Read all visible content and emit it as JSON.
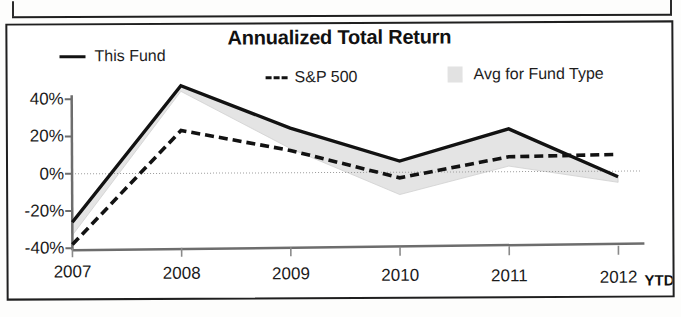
{
  "chart": {
    "title": "Annualized Total Return",
    "legend": [
      {
        "label": "This Fund",
        "marker": "solid-line-swatch"
      },
      {
        "label": "S&P 500",
        "marker": "dashed-line-swatch"
      },
      {
        "label": "Avg for Fund Type",
        "marker": "area-swatch"
      }
    ],
    "ytd_suffix": "YTD"
  },
  "chart_data": {
    "type": "line",
    "title": "Annualized Total Return",
    "xlabel": "",
    "ylabel": "",
    "categories": [
      "2007",
      "2008",
      "2009",
      "2010",
      "2011",
      "2012"
    ],
    "x_tick_labels": [
      "2007",
      "2008",
      "2009",
      "2010",
      "2011",
      "2012"
    ],
    "x_axis_note": "YTD",
    "y_tick_labels": [
      "40%",
      "20%",
      "0%",
      "-20%",
      "-40%"
    ],
    "y_ticks": [
      40,
      20,
      0,
      -20,
      -40
    ],
    "ylim": [
      -40,
      50
    ],
    "grid": false,
    "legend_position": "top",
    "series": [
      {
        "name": "This Fund",
        "style": "solid",
        "color": "#121212",
        "values": [
          -26,
          47,
          24,
          6,
          23,
          -3
        ]
      },
      {
        "name": "S&P 500",
        "style": "dashed",
        "color": "#121212",
        "values": [
          -38,
          23,
          12,
          -3,
          8,
          9
        ]
      },
      {
        "name": "Avg for Fund Type",
        "style": "filled-area",
        "color": "#e4e4e4",
        "values": [
          -33,
          44,
          13,
          -12,
          3,
          -6
        ]
      }
    ]
  }
}
